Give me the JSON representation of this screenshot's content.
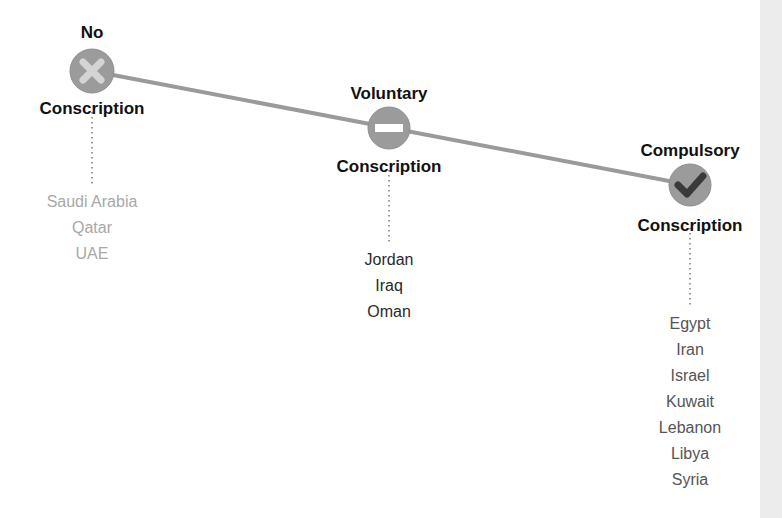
{
  "colors": {
    "line": "#9a9a9a",
    "node_fill": "#9b9b9b",
    "node_stroke": "#8f8f8f",
    "dotted_connector": "#9a9a9a",
    "icon_light": "#d4d4d4",
    "icon_dark": "#3a3a3a",
    "side_strip": "#ececec"
  },
  "nodes": [
    {
      "id": "no",
      "title_top": "No",
      "title_bottom": "Conscription",
      "icon": "x-icon",
      "countries_color": "#a8a8a8",
      "countries": [
        "Saudi Arabia",
        "Qatar",
        "UAE"
      ]
    },
    {
      "id": "voluntary",
      "title_top": "Voluntary",
      "title_bottom": "Conscription",
      "icon": "minus-icon",
      "countries_color": "#2a2a2a",
      "countries": [
        "Jordan",
        "Iraq",
        "Oman"
      ]
    },
    {
      "id": "compulsory",
      "title_top": "Compulsory",
      "title_bottom": "Conscription",
      "icon": "check-icon",
      "countries_color": "#555555",
      "countries": [
        "Egypt",
        "Iran",
        "Israel",
        "Kuwait",
        "Lebanon",
        "Libya",
        "Syria"
      ]
    }
  ]
}
